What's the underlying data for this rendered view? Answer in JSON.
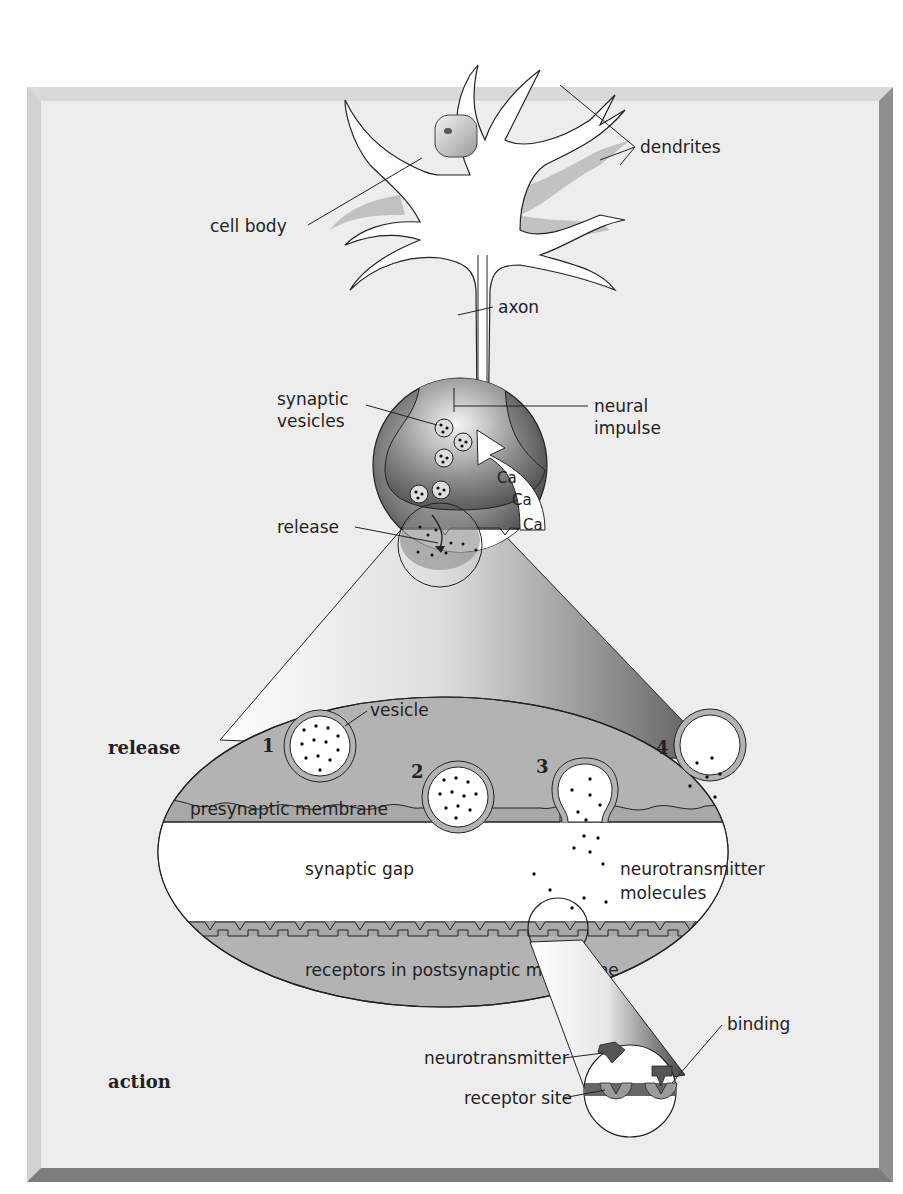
{
  "figure": {
    "neuron_labels": {
      "dendrites": "dendrites",
      "cell_body": "cell body",
      "axon": "axon"
    },
    "terminal_labels": {
      "synaptic_vesicles_line1": "synaptic",
      "synaptic_vesicles_line2": "vesicles",
      "neural_impulse_line1": "neural",
      "neural_impulse_line2": "impulse",
      "release": "release",
      "calcium": [
        "Ca",
        "Ca",
        "Ca"
      ]
    },
    "synapse_panel": {
      "section_label": "release",
      "vesicle": "vesicle",
      "stages": [
        "1",
        "2",
        "3",
        "4"
      ],
      "presynaptic_membrane": "presynaptic membrane",
      "synaptic_gap": "synaptic gap",
      "neurotransmitter_molecules_line1": "neurotransmitter",
      "neurotransmitter_molecules_line2": "molecules",
      "receptors": "receptors in postsynaptic membrane"
    },
    "action_panel": {
      "section_label": "action",
      "neurotransmitter": "neurotransmitter",
      "receptor_site": "receptor site",
      "binding": "binding"
    },
    "colors": {
      "panel_bg": "#ededed",
      "frame_light": "#d6d6d6",
      "frame_dark": "#8a8a8a",
      "membrane_gray": "#b3b3b3",
      "terminal_dark": "#5a5a5a",
      "outline": "#222222"
    }
  }
}
